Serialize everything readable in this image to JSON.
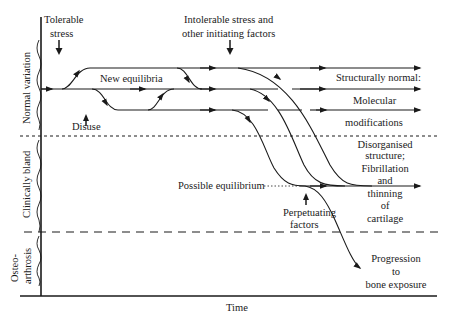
{
  "figure": {
    "x_axis_label": "Time",
    "zones": [
      {
        "id": "normal",
        "label": "Normal variation"
      },
      {
        "id": "bland",
        "label": "Clinically bland"
      },
      {
        "id": "oa",
        "label_line1": "Osteo-",
        "label_line2": "arthrosis"
      }
    ],
    "annotations": {
      "tolerable_stress": {
        "line1": "Tolerable",
        "line2": "stress"
      },
      "intolerable_stress": {
        "line1": "Intolerable stress and",
        "line2": "other initiating factors"
      },
      "new_equilibria": "New equilibria",
      "disuse": "Disuse",
      "possible_equilibrium": "Possible equilibrium",
      "perpetuating_factors": {
        "line1": "Perpetuating",
        "line2": "factors"
      }
    },
    "outcomes": {
      "structurally_normal": "Structurally normal:",
      "molecular": {
        "line1": "Molecular",
        "line2": "modifications"
      },
      "disorganised": {
        "line1": "Disorganised",
        "line2": "structure;",
        "line3": "Fibrillation",
        "line4": "and",
        "line5": "thinning",
        "line6": "of",
        "line7": "cartilage"
      },
      "progression": {
        "line1": "Progression",
        "line2": "to",
        "line3": "bone exposure"
      }
    }
  }
}
